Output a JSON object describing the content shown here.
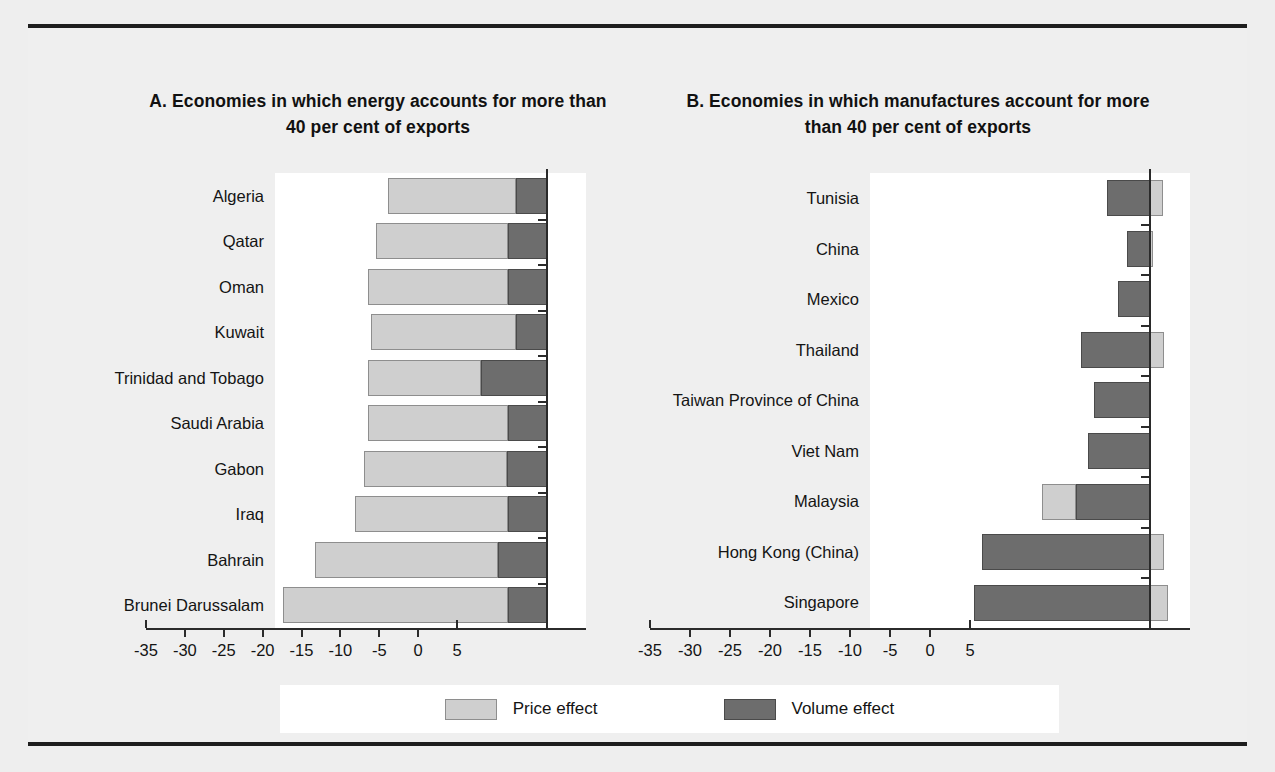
{
  "figure": {
    "legend": {
      "price_label": "Price effect",
      "volume_label": "Volume effect",
      "price_color": "#cfcfcf",
      "volume_color": "#6d6d6d"
    }
  },
  "chart_data": [
    {
      "type": "bar",
      "panel": "A",
      "title": "A. Economies in which energy accounts for more than 40 per cent of exports",
      "orientation": "horizontal",
      "stacked": true,
      "xlabel": "",
      "ylabel": "",
      "xlim": [
        -35,
        5
      ],
      "xticks": [
        -35,
        -30,
        -25,
        -20,
        -15,
        -10,
        -5,
        0,
        5
      ],
      "xticklabels": [
        "-35",
        "-30",
        "-25",
        "-20",
        "-15",
        "-10",
        "-5",
        "0",
        "5"
      ],
      "grid": false,
      "legend_position": "bottom-center",
      "categories": [
        "Algeria",
        "Qatar",
        "Oman",
        "Kuwait",
        "Trinidad and Tobago",
        "Saudi Arabia",
        "Gabon",
        "Iraq",
        "Bahrain",
        "Brunei Darussalam"
      ],
      "series": [
        {
          "name": "Price effect",
          "color": "#cfcfcf",
          "values": [
            -16.5,
            -17.0,
            -18.0,
            -18.6,
            -14.5,
            -18.0,
            -18.3,
            -19.7,
            -23.5,
            -29.0
          ]
        },
        {
          "name": "Volume effect",
          "color": "#6d6d6d",
          "values": [
            -4.0,
            -5.0,
            -5.0,
            -4.0,
            -8.5,
            -5.0,
            -5.2,
            -5.0,
            -6.3,
            -5.0
          ]
        }
      ],
      "totals": [
        -20.5,
        -22.0,
        -23.0,
        -22.6,
        -23.0,
        -23.0,
        -23.5,
        -24.7,
        -29.8,
        -34.0
      ]
    },
    {
      "type": "bar",
      "panel": "B",
      "title": "B. Economies in which manufactures account for more than 40 per cent of exports",
      "orientation": "horizontal",
      "stacked": true,
      "xlabel": "",
      "ylabel": "",
      "xlim": [
        -35,
        5
      ],
      "xticks": [
        -35,
        -30,
        -25,
        -20,
        -15,
        -10,
        -5,
        0,
        5
      ],
      "xticklabels": [
        "-35",
        "-30",
        "-25",
        "-20",
        "-15",
        "-10",
        "-5",
        "0",
        "5"
      ],
      "grid": false,
      "legend_position": "bottom-center",
      "categories": [
        "Tunisia",
        "China",
        "Mexico",
        "Thailand",
        "Taiwan Province of China",
        "Viet Nam",
        "Malaysia",
        "Hong Kong (China)",
        "Singapore"
      ],
      "series": [
        {
          "name": "Price effect",
          "color": "#cfcfcf",
          "values": [
            1.6,
            0.4,
            0.0,
            1.8,
            0.0,
            0.0,
            -4.2,
            1.7,
            2.2
          ]
        },
        {
          "name": "Volume effect",
          "color": "#6d6d6d",
          "values": [
            -5.4,
            -2.9,
            -4.0,
            -8.6,
            -7.0,
            -7.8,
            -9.3,
            -21.0,
            -22.0
          ]
        }
      ],
      "totals": [
        -3.8,
        -2.5,
        -4.0,
        -6.8,
        -7.0,
        -7.8,
        -13.5,
        -19.3,
        -19.8
      ]
    }
  ]
}
